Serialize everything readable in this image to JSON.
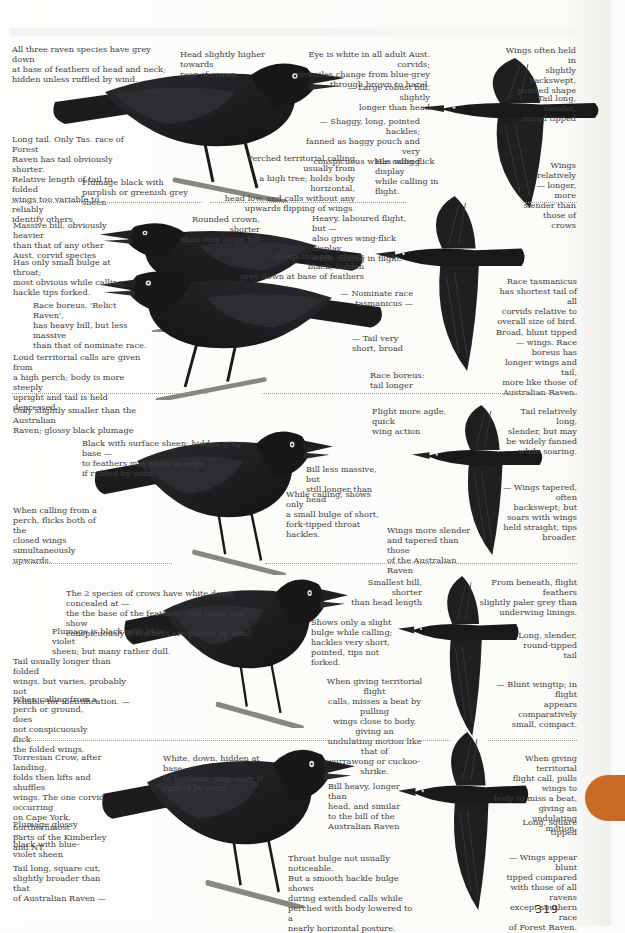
{
  "page": {
    "number": "319",
    "tab_color": "#c96a27",
    "background": "#fbfbf9"
  },
  "sections": [
    {
      "id": "section-1",
      "illustrations": [
        "perched-raven",
        "flying-raven-underside"
      ],
      "notes": {
        "grey_down": "All three raven species have grey down\nat base of feathers of head and neck;\nhidden unless ruffled by wind.",
        "head": "Head slightly higher towards\nrear of crown",
        "eye": "Eye is white in all adult Aust. corvids;\njuveniles change from blue-grey\nthrough brown to hazel.",
        "bill": "— Large robust bill, slightly\nlonger than head",
        "hackles": "— Shaggy, long, pointed hackles;\nfanned as baggy pouch and very\nconspicuous while calling",
        "tail": "Long tail.  Only Tas. race of Forest\nRaven has tail obviously shorter.\nRelative length of tail to folded\nwings too variable to reliably\nidentify others",
        "plumage": "Plumage black with\npurplish or greenish grey sheen",
        "perched_calling": "Perched territorial calling usually from\na high tree; holds body horizontal,\nhead low, and calls without any\nupwards flipping of wings.",
        "wing_flick": "Has wing-flick display\nwhile calling in flight.",
        "wings_backswept": "Wings often held in\nslightly backswept,\npointed shape",
        "tail_flight": "Tail long, slender,\nround tipped",
        "wings_longer": "Wings relatively\n— longer, more\nslender than\nthose of crows"
      }
    },
    {
      "id": "section-2",
      "illustrations": [
        "two-perched-ravens",
        "flying-raven-underside"
      ],
      "notes": {
        "massive_bill": "Massive bill, obviously heavier\nthan that of any other\nAust. corvid species",
        "crown": "Rounded crown, shorter\nthan very large bill",
        "throat": "Has only small bulge at throat;\nmost obvious while calling;\nhackle tips forked.",
        "boreus": "Race boreus, 'Relict Raven',\nhas heavy bill, but less massive\nthan that of nominate race.",
        "loud_calls": "Loud territorial calls are given from\na high perch; body is more steeply\nupright and tail is held depressed.",
        "heavy_flight": "Heavy, laboured flight, but —\nalso gives wing-flick display\nwhile calling in flight.",
        "deep_black": "— Deep, intense, glossy black; hidden\ngrey down at base of feathers",
        "nominate": "— Nominate race\ntasmanicus —",
        "tail_short": "— Tail very\nshort, broad",
        "boreus_tail": "Race boreus:\ntail longer",
        "tasmanicus_tail": "Race tasmanicus\nhas shortest tail of all\ncorvids relative to\noverall size of bird.",
        "broad_wings": "Broad, blunt tipped\n— wings. Race boreus has\nlonger wings and tail,\nmore like those of\nAustralian Raven."
      }
    },
    {
      "id": "section-3",
      "illustrations": [
        "perched-raven-calling",
        "flying-raven-underside"
      ],
      "notes": {
        "size": "Only slightly smaller than the Australian\nRaven; glossy black plumage",
        "surface_sheen": "Black with surface sheen; hidden grey base —\nto feathers may show at nape\nif ruffled by wind.",
        "bill_less": "Bill less massive, but\nstill longer than head",
        "calling_bulge": "While calling, shows only\na small bulge of short,\nfork-tipped throat hackles.",
        "flicks_wings": "When calling from a\nperch, flicks both of the\nclosed wings\nsimultaneously\nupwards.",
        "agile": "Flight more agile, quick\nwing action",
        "tail_fanned": "Tail relatively long,\nslender, but may\nbe widely fanned\nwhile soaring.",
        "wings_tapered": "— Wings tapered, often\nbackswept; but\nsoars with wings\nheld straight, tips\nbroader.",
        "slender_wings": "Wings more slender\nand tapered than those\nof the Australian Raven"
      }
    },
    {
      "id": "section-4",
      "illustrations": [
        "perched-crow",
        "flying-crow-underside"
      ],
      "notes": {
        "white_down": "The 2 species of crows have white down concealed at —\nthe the base of the feathers; this white may show\nconspicuously if feathers are parted by wind.",
        "blue_violet": "Plumage is black with blue-violet\nsheen; but many rather dull.",
        "tail_varies": "Tail usually longer than folded\nwings, but varies, probably not\nreliable for identification. —",
        "no_flick": "When calling from a\nperch or ground, does\nnot conspicuously flick\nthe folded wings.",
        "smallest_bill": "Smallest bill, shorter\nthan head length",
        "slight_bulge": "Shows only a slight\nbulge while calling;\nhackles very short,\npointed, tips not forked.",
        "undulating": "When giving territorial flight\ncalls, misses a beat by pulling\nwings close to body, giving an\nundulating motion like that of\ncurrawong or cuckoo-shrike.",
        "paler_grey": "From beneath, flight feathers\nslightly paler grey than\nunderwing linings.",
        "round_tail": "Long, slender,\nround-tipped tail",
        "blunt_wingtip": "— Blunt wingtip; in flight\nappears comparatively\nsmall, compact."
      }
    },
    {
      "id": "section-5",
      "illustrations": [
        "perched-torresian-crow",
        "flying-crow-underside"
      ],
      "notes": {
        "torresian": "Torresian Crow, after landing,\nfolds then lifts and shuffles\nwings. The one corvid occurring\non Cape York, northernmost\nparts of the Kimberley and NT.",
        "white_down": "White, down, hidden at base —\nof feathers; may show if\nruffled by wind.",
        "glossy": "Plumage glossy   —\nblack with blue-\nviolet sheen",
        "square_tail": "Tail long, square cut,\nslightly broader than that\nof Australian Raven    —",
        "bill_heavy": "Bill heavy, longer than\nhead, and similar\nto the bill of the\nAustralian Raven",
        "throat_bulge": "Throat bulge not usually noticeable.\nBut a smooth hackle bulge shows\nduring extended calls while\nperched with body lowered to a\nnearly horizontal posture.",
        "flight_call": "When giving territorial\nflight call, pulls wings to\nbody to miss a beat,\ngiving an undulating\nmotion.",
        "square_tipped": "Long, square tipped",
        "blunt_tipped": "— Wings appear blunt\ntipped compared\nwith those of all ravens\nexcept southern race\nof Forest Raven."
      }
    }
  ]
}
